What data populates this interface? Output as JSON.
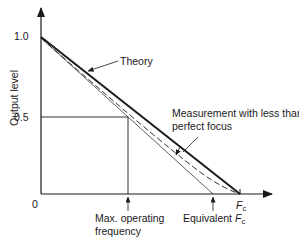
{
  "diagram": {
    "y_axis_label": "Output level",
    "y_ticks": [
      {
        "label": "1.0",
        "value": 1.0
      },
      {
        "label": "0.5",
        "value": 0.5
      }
    ],
    "origin_label": "0",
    "x_axis_end_label": "F",
    "x_axis_end_subscript": "c",
    "curves": [
      {
        "name": "Theory",
        "style": "solid-thick"
      },
      {
        "name": "Measurement with less than perfect focus",
        "style": "dashed"
      },
      {
        "name": "Equivalent linear approximation",
        "style": "solid-thin"
      }
    ],
    "annotations": {
      "theory": "Theory",
      "measurement_line1": "Measurement with less than",
      "measurement_line2": "perfect focus",
      "max_freq_line1": "Max. operating",
      "max_freq_line2": "frequency",
      "equivalent_prefix": "Equivalent ",
      "equivalent_F": "F",
      "equivalent_sub": "c"
    },
    "colors": {
      "ink": "#1a1a1a",
      "background": "#ffffff"
    }
  }
}
